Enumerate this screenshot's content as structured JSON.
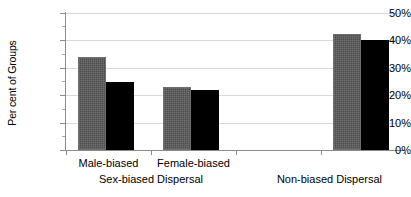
{
  "chart_data": {
    "type": "bar",
    "title": "",
    "xlabel": "",
    "ylabel": "Per cent of Groups",
    "ylim": [
      0,
      50
    ],
    "ytick_labels": [
      "50%",
      "40%",
      "30%",
      "20%",
      "10%",
      "0%"
    ],
    "ytick_values": [
      50,
      40,
      30,
      20,
      10,
      0
    ],
    "grid": true,
    "legend": "none",
    "categories": [
      "Male-biased",
      "Female-biased",
      "",
      "Non-biased Dispersal"
    ],
    "group_labels": [
      "Sex-biased Dispersal",
      "Non-biased Dispersal"
    ],
    "series": [
      {
        "name": "gray",
        "color": "#4d4d4d",
        "values": [
          34,
          23,
          null,
          42.5
        ]
      },
      {
        "name": "black",
        "color": "#000000",
        "values": [
          25,
          22,
          null,
          40
        ]
      }
    ],
    "bars": [
      {
        "category": "Male-biased",
        "series": "gray",
        "value": 34,
        "value_label": "34%"
      },
      {
        "category": "Male-biased",
        "series": "black",
        "value": 25,
        "value_label": "25%"
      },
      {
        "category": "Female-biased",
        "series": "gray",
        "value": 23,
        "value_label": "23%"
      },
      {
        "category": "Female-biased",
        "series": "black",
        "value": 22,
        "value_label": "22%"
      },
      {
        "category": "Non-biased Dispersal",
        "series": "gray",
        "value": 42.5,
        "value_label": "42.5%"
      },
      {
        "category": "Non-biased Dispersal",
        "series": "black",
        "value": 40,
        "value_label": "40%"
      }
    ]
  },
  "axis": {
    "y_title": "Per cent of Groups",
    "ticks": {
      "t50": "50%",
      "t40": "40%",
      "t30": "30%",
      "t20": "20%",
      "t10": "10%",
      "t0": "0%"
    }
  },
  "categories": {
    "male_biased": "Male-biased",
    "female_biased": "Female-biased",
    "non_biased": "Non-biased Dispersal",
    "sex_biased_group": "Sex-biased Dispersal"
  }
}
